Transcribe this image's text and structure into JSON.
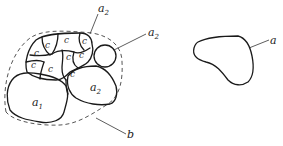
{
  "figure": {
    "left_panel": {
      "boundary_label": "b",
      "cell_label": "c",
      "cell_count": 10,
      "aggregate_labels": [
        {
          "base": "a",
          "sub": "1",
          "desc": "large lower-left particle"
        },
        {
          "base": "a",
          "sub": "2",
          "desc": "lower-right particle"
        },
        {
          "base": "a",
          "sub": "2",
          "desc": "top leader label"
        },
        {
          "base": "a",
          "sub": "2",
          "desc": "small round particle leader label"
        }
      ]
    },
    "right_panel": {
      "particle_label": "a"
    }
  }
}
